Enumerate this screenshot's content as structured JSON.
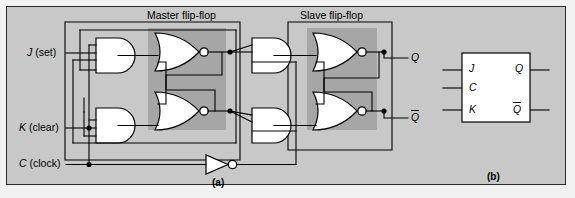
{
  "figure": {
    "title_master": "Master flip-flop",
    "title_slave": "Slave flip-flop",
    "caption_a": "(a)",
    "caption_b": "(b)",
    "background_outer": "#f2f2f2",
    "panel_fill": "#c8c8c8",
    "latch_box_fill": "#a6a6a6",
    "gate_fill": "#ffffff",
    "line_color": "#000000"
  },
  "inputs": [
    {
      "name": "J",
      "desc": "(set)",
      "full": "J (set)"
    },
    {
      "name": "K",
      "desc": "(clear)",
      "full": "K (clear)"
    },
    {
      "name": "C",
      "desc": "(clock)",
      "full": "C (clock)"
    }
  ],
  "outputs": [
    {
      "name": "Q",
      "overbar": false
    },
    {
      "name": "Q",
      "overbar": true
    }
  ],
  "gates": [
    {
      "id": "and-j",
      "type": "AND",
      "section": "master-input"
    },
    {
      "id": "and-k",
      "type": "AND",
      "section": "master-input"
    },
    {
      "id": "nor-master-top",
      "type": "NOR",
      "section": "master-latch"
    },
    {
      "id": "nor-master-bottom",
      "type": "NOR",
      "section": "master-latch"
    },
    {
      "id": "and-slave-top",
      "type": "AND",
      "section": "slave-input"
    },
    {
      "id": "and-slave-bottom",
      "type": "AND",
      "section": "slave-input"
    },
    {
      "id": "nor-slave-top",
      "type": "NOR",
      "section": "slave-latch"
    },
    {
      "id": "nor-slave-bottom",
      "type": "NOR",
      "section": "slave-latch"
    },
    {
      "id": "inverter-clock",
      "type": "NOT",
      "section": "clock"
    }
  ],
  "symbol_block": {
    "inputs": [
      {
        "label": "J",
        "overbar": false
      },
      {
        "label": "C",
        "overbar": false
      },
      {
        "label": "K",
        "overbar": false
      }
    ],
    "outputs": [
      {
        "label": "Q",
        "overbar": false
      },
      {
        "label": "Q",
        "overbar": true
      }
    ]
  }
}
